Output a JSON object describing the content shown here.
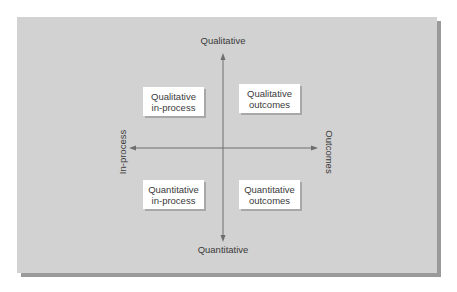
{
  "diagram": {
    "axes": {
      "top": "Qualitative",
      "bottom": "Quantitative",
      "left": "In-process",
      "right": "Outcomes"
    },
    "quadrants": {
      "top_left": {
        "line1": "Qualitative",
        "line2": "in-process"
      },
      "top_right": {
        "line1": "Qualitative",
        "line2": "outcomes"
      },
      "bottom_left": {
        "line1": "Quantitative",
        "line2": "in-process"
      },
      "bottom_right": {
        "line1": "Quantitative",
        "line2": "outcomes"
      }
    },
    "colors": {
      "panel": "#d2d2d2",
      "shadow": "#9a9a9a",
      "axis": "#6e6e6e",
      "box": "#ffffff",
      "text": "#3a3a3a"
    }
  }
}
